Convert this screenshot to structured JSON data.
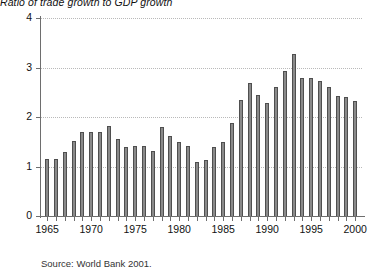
{
  "chart_data": {
    "type": "bar",
    "title": "Ratio of trade growth to GDP growth",
    "subtitle": "",
    "xlabel": "",
    "ylabel": "",
    "ylim": [
      0,
      4
    ],
    "yticks": [
      0,
      1,
      2,
      3,
      4
    ],
    "ytick_labels": [
      "0",
      "1",
      "2",
      "3",
      "4"
    ],
    "grid": true,
    "grid_axis": "y",
    "legend": false,
    "legend_position": "none",
    "bar_color": "#8a8a8a",
    "bar_edge_color": "#4f4f4f",
    "axis_color": "#6e6e6e",
    "grid_color": "#b9b9b9",
    "xlim": [
      1964.3,
      2001.0
    ],
    "xtick_labels": [
      "1965",
      "1970",
      "1975",
      "1980",
      "1985",
      "1990",
      "1995",
      "2000"
    ],
    "xtick_label_years": [
      1965,
      1970,
      1975,
      1980,
      1985,
      1990,
      1995,
      2000
    ],
    "minor_xticks_every": 1,
    "categories": [
      1965,
      1966,
      1967,
      1968,
      1969,
      1970,
      1971,
      1972,
      1973,
      1974,
      1975,
      1976,
      1977,
      1978,
      1979,
      1980,
      1981,
      1982,
      1983,
      1984,
      1985,
      1986,
      1987,
      1988,
      1989,
      1990,
      1991,
      1992,
      1993,
      1994,
      1995,
      1996,
      1997,
      1998,
      1999,
      2000
    ],
    "values": [
      1.15,
      1.15,
      1.3,
      1.52,
      1.7,
      1.7,
      1.7,
      1.82,
      1.55,
      1.4,
      1.42,
      1.42,
      1.32,
      1.8,
      1.62,
      1.5,
      1.42,
      1.1,
      1.13,
      1.4,
      1.5,
      1.88,
      2.35,
      2.68,
      2.45,
      2.28,
      2.6,
      2.92,
      3.27,
      2.78,
      2.78,
      2.72,
      2.6,
      2.42,
      2.4,
      2.33
    ],
    "source": "Source: World Bank 2001."
  },
  "figure": {
    "title": "Ratio of trade growth to GDP growth",
    "source": "Source: World Bank 2001."
  }
}
